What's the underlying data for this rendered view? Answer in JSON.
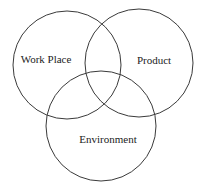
{
  "diagram": {
    "type": "venn",
    "sets": [
      {
        "id": "work-place",
        "label": "Work Place",
        "cx": 67,
        "cy": 65,
        "r": 54,
        "label_x": 46,
        "label_y": 63
      },
      {
        "id": "product",
        "label": "Product",
        "cx": 139,
        "cy": 63,
        "r": 54,
        "label_x": 154,
        "label_y": 64
      },
      {
        "id": "environment",
        "label": "Environment",
        "cx": 101,
        "cy": 126,
        "r": 55,
        "label_x": 108,
        "label_y": 143
      }
    ],
    "stroke_color": "#3a3a3a",
    "text_color": "#222222"
  }
}
